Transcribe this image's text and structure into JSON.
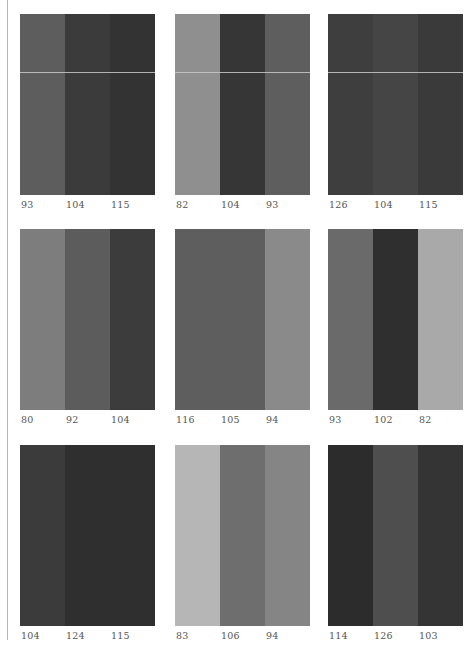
{
  "panels": [
    {
      "labels": [
        "93",
        "104",
        "115"
      ],
      "colors": [
        "#5d5d5d",
        "#3b3b3b",
        "#333333"
      ],
      "divider": true
    },
    {
      "labels": [
        "82",
        "104",
        "93"
      ],
      "colors": [
        "#8f8f8f",
        "#363636",
        "#5e5e5e"
      ],
      "divider": true
    },
    {
      "labels": [
        "126",
        "104",
        "115"
      ],
      "colors": [
        "#3e3e3e",
        "#454545",
        "#3a3a3a"
      ],
      "divider": true
    },
    {
      "labels": [
        "80",
        "92",
        "104"
      ],
      "colors": [
        "#7d7d7d",
        "#5c5c5c",
        "#3c3c3c"
      ],
      "divider": false
    },
    {
      "labels": [
        "116",
        "105",
        "94"
      ],
      "colors": [
        "#5e5e5e",
        "#5e5e5e",
        "#8a8a8a"
      ],
      "divider": false
    },
    {
      "labels": [
        "93",
        "102",
        "82"
      ],
      "colors": [
        "#6a6a6a",
        "#2f2f2f",
        "#a9a9a9"
      ],
      "divider": false
    },
    {
      "labels": [
        "104",
        "124",
        "115"
      ],
      "colors": [
        "#3b3b3b",
        "#2f2f2f",
        "#2f2f2f"
      ],
      "divider": false
    },
    {
      "labels": [
        "83",
        "106",
        "94"
      ],
      "colors": [
        "#b6b6b6",
        "#6e6e6e",
        "#858585"
      ],
      "divider": false
    },
    {
      "labels": [
        "114",
        "126",
        "103"
      ],
      "colors": [
        "#2c2c2c",
        "#4e4e4e",
        "#343434"
      ],
      "divider": false
    }
  ]
}
